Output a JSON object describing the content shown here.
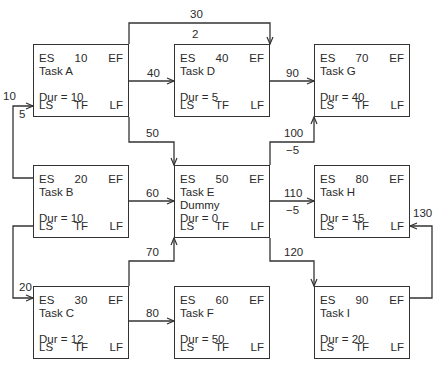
{
  "diagram": {
    "type": "precedence-network",
    "box_fields": {
      "es": "ES",
      "ef": "EF",
      "ls": "LS",
      "tf": "TF",
      "lf": "LF",
      "dur_prefix": "Dur = "
    },
    "tasks": [
      {
        "id": "A",
        "label": "Task A",
        "number": "10",
        "dur": "Dur = 10",
        "sub": ""
      },
      {
        "id": "B",
        "label": "Task B",
        "number": "20",
        "dur": "Dur = 10",
        "sub": ""
      },
      {
        "id": "C",
        "label": "Task C",
        "number": "30",
        "dur": "Dur = 12",
        "sub": ""
      },
      {
        "id": "D",
        "label": "Task D",
        "number": "40",
        "dur": "Dur = 5",
        "sub": ""
      },
      {
        "id": "E",
        "label": "Task E",
        "number": "50",
        "dur": "Dur = 0",
        "sub": "Dummy"
      },
      {
        "id": "F",
        "label": "Task F",
        "number": "60",
        "dur": "Dur = 50",
        "sub": ""
      },
      {
        "id": "G",
        "label": "Task G",
        "number": "70",
        "dur": "Dur = 40",
        "sub": ""
      },
      {
        "id": "H",
        "label": "Task H",
        "number": "80",
        "dur": "Dur = 15",
        "sub": ""
      },
      {
        "id": "I",
        "label": "Task I",
        "number": "90",
        "dur": "Dur = 20",
        "sub": ""
      }
    ],
    "links": [
      {
        "number": "10",
        "lag": "5",
        "from": "B",
        "to": "A"
      },
      {
        "number": "20",
        "lag": "",
        "from": "B",
        "to": "C"
      },
      {
        "number": "30",
        "lag": "2",
        "from": "A",
        "to": "D"
      },
      {
        "number": "40",
        "lag": "",
        "from": "A",
        "to": "D"
      },
      {
        "number": "50",
        "lag": "",
        "from": "A",
        "to": "E"
      },
      {
        "number": "60",
        "lag": "",
        "from": "B",
        "to": "E"
      },
      {
        "number": "70",
        "lag": "",
        "from": "C",
        "to": "E"
      },
      {
        "number": "80",
        "lag": "",
        "from": "C",
        "to": "F"
      },
      {
        "number": "90",
        "lag": "",
        "from": "D",
        "to": "G"
      },
      {
        "number": "100",
        "lag": "−5",
        "from": "E",
        "to": "G"
      },
      {
        "number": "110",
        "lag": "−5",
        "from": "E",
        "to": "H"
      },
      {
        "number": "120",
        "lag": "",
        "from": "E",
        "to": "I"
      },
      {
        "number": "130",
        "lag": "",
        "from": "I",
        "to": "H"
      }
    ]
  }
}
